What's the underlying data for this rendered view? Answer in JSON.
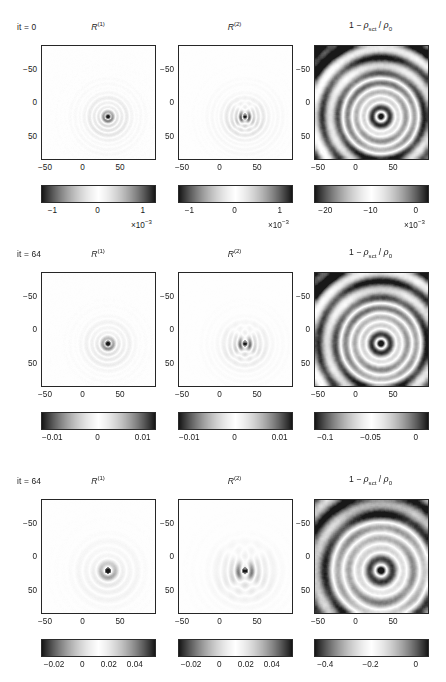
{
  "figure": {
    "type": "multi-panel-image-grid",
    "rows": 3,
    "columns": 3,
    "colormap": "diverging-gray (dark-white-dark)",
    "background": "#ffffff",
    "axis_color": "#262626"
  },
  "columns": [
    {
      "key": "R1",
      "title_main": "R",
      "title_sup": "(1)",
      "title_plain": "R^(1)"
    },
    {
      "key": "R2",
      "title_main": "R",
      "title_sup": "(2)",
      "title_plain": "R^(2)"
    },
    {
      "key": "rho",
      "title_plain": "1 − ρ_sct / ρ_0",
      "prefix": "1 − ",
      "rho_sym": "ρ",
      "sub_sct": "sct",
      "slash": " / ",
      "sub_0": "0"
    }
  ],
  "axes": {
    "x_ticks": [
      "−50",
      "0",
      "50"
    ],
    "y_ticks": [
      "−50",
      "0",
      "50"
    ],
    "x_tick_values": [
      -50,
      0,
      50
    ],
    "y_tick_values": [
      -50,
      0,
      50
    ],
    "xlim": [
      -75,
      75
    ],
    "ylim": [
      -75,
      75
    ],
    "grid": "off",
    "y_direction": "increasing-downward"
  },
  "rows": [
    {
      "id": "row-0",
      "it_label": "it = 0",
      "it_value": 0,
      "panels": [
        {
          "column": "R1",
          "cbar_ticks": [
            "−1",
            "0",
            "1"
          ],
          "cbar_tick_values": [
            -1,
            0,
            1
          ],
          "cbar_exponent": "×10",
          "cbar_exponent_sup": "−3",
          "cbar_range": [
            -1.6,
            1.6
          ],
          "cbar_units_scale": 0.001
        },
        {
          "column": "R2",
          "cbar_ticks": [
            "−1",
            "0",
            "1"
          ],
          "cbar_tick_values": [
            -1,
            0,
            1
          ],
          "cbar_exponent": "×10",
          "cbar_exponent_sup": "−3",
          "cbar_range": [
            -1.6,
            1.6
          ],
          "cbar_units_scale": 0.001
        },
        {
          "column": "rho",
          "cbar_ticks": [
            "−20",
            "−10",
            "0"
          ],
          "cbar_tick_values": [
            -20,
            -10,
            0
          ],
          "cbar_exponent": "×10",
          "cbar_exponent_sup": "−3",
          "cbar_range": [
            -23,
            3
          ],
          "cbar_units_scale": 0.001
        }
      ]
    },
    {
      "id": "row-1",
      "it_label": "it = 64",
      "it_value": 64,
      "panels": [
        {
          "column": "R1",
          "cbar_ticks": [
            "−0.01",
            "0",
            "0.01"
          ],
          "cbar_tick_values": [
            -0.01,
            0,
            0.01
          ],
          "cbar_exponent": null,
          "cbar_exponent_sup": null,
          "cbar_range": [
            -0.016,
            0.016
          ],
          "cbar_units_scale": 1
        },
        {
          "column": "R2",
          "cbar_ticks": [
            "−0.01",
            "0",
            "0.01"
          ],
          "cbar_tick_values": [
            -0.01,
            0,
            0.01
          ],
          "cbar_exponent": null,
          "cbar_exponent_sup": null,
          "cbar_range": [
            -0.016,
            0.016
          ],
          "cbar_units_scale": 1
        },
        {
          "column": "rho",
          "cbar_ticks": [
            "−0.1",
            "−0.05",
            "0"
          ],
          "cbar_tick_values": [
            -0.1,
            -0.05,
            0
          ],
          "cbar_exponent": null,
          "cbar_exponent_sup": null,
          "cbar_range": [
            -0.115,
            0.015
          ],
          "cbar_units_scale": 1
        }
      ]
    },
    {
      "id": "row-2",
      "it_label": "it = 64",
      "it_value": 64,
      "panels": [
        {
          "column": "R1",
          "cbar_ticks": [
            "−0.02",
            "0",
            "0.02",
            "0.04"
          ],
          "cbar_tick_values": [
            -0.02,
            0,
            0.02,
            0.04
          ],
          "cbar_exponent": null,
          "cbar_exponent_sup": null,
          "cbar_range": [
            -0.034,
            0.052
          ],
          "cbar_units_scale": 1
        },
        {
          "column": "R2",
          "cbar_ticks": [
            "−0.02",
            "0",
            "0.02",
            "0.04"
          ],
          "cbar_tick_values": [
            -0.02,
            0,
            0.02,
            0.04
          ],
          "cbar_exponent": null,
          "cbar_exponent_sup": null,
          "cbar_range": [
            -0.034,
            0.052
          ],
          "cbar_units_scale": 1
        },
        {
          "column": "rho",
          "cbar_ticks": [
            "−0.4",
            "−0.2",
            "0"
          ],
          "cbar_tick_values": [
            -0.4,
            -0.2,
            0
          ],
          "cbar_exponent": null,
          "cbar_exponent_sup": null,
          "cbar_range": [
            -0.46,
            0.06
          ],
          "cbar_units_scale": 1
        }
      ]
    }
  ],
  "chart_data": {
    "type": "heatmap",
    "title": "",
    "xlabel": "",
    "ylabel": "",
    "grid": false,
    "legend": "colorbar-below-each-panel",
    "panel_fields": [
      {
        "row": 0,
        "column": "R1",
        "pattern": "concentric-rings",
        "center": [
          12,
          18
        ],
        "n_rings": 9,
        "ring_period_px": 9.5,
        "amplitude_peak": 0.0016,
        "decay": 0.055,
        "source_offset": [
          0,
          0
        ],
        "noise": 0.055,
        "ringing_asym": 0.25
      },
      {
        "row": 0,
        "column": "R2",
        "pattern": "concentric-rings-dipole",
        "center": [
          12,
          18
        ],
        "n_rings": 9,
        "ring_period_px": 9.5,
        "amplitude_peak": 0.0016,
        "decay": 0.05,
        "dipole": 0.75,
        "noise": 0.055,
        "ringing_asym": 0.4
      },
      {
        "row": 0,
        "column": "rho",
        "pattern": "smooth-concentric-blobs",
        "center": [
          12,
          18
        ],
        "n_rings": 4,
        "ring_period_px": 17,
        "amplitude_peak": 0.021,
        "decay": 0.02,
        "noise": 0.12,
        "smooth": 2.6,
        "corner_dark": true
      },
      {
        "row": 1,
        "column": "R1",
        "pattern": "concentric-rings",
        "center": [
          12,
          18
        ],
        "n_rings": 8,
        "ring_period_px": 11,
        "amplitude_peak": 0.015,
        "decay": 0.06,
        "noise": 0.05,
        "ringing_asym": 0.28
      },
      {
        "row": 1,
        "column": "R2",
        "pattern": "concentric-rings-dipole",
        "center": [
          12,
          18
        ],
        "n_rings": 8,
        "ring_period_px": 11,
        "amplitude_peak": 0.015,
        "decay": 0.055,
        "dipole": 0.8,
        "noise": 0.05,
        "ringing_asym": 0.45
      },
      {
        "row": 1,
        "column": "rho",
        "pattern": "smooth-concentric-blobs",
        "center": [
          12,
          18
        ],
        "n_rings": 4,
        "ring_period_px": 18,
        "amplitude_peak": 0.105,
        "decay": 0.018,
        "noise": 0.13,
        "smooth": 2.4,
        "corner_dark": true
      },
      {
        "row": 2,
        "column": "R1",
        "pattern": "concentric-rings-sparse",
        "center": [
          12,
          18
        ],
        "n_rings": 5,
        "ring_period_px": 15,
        "amplitude_peak": 0.05,
        "decay": 0.05,
        "noise": 0.045,
        "ringing_asym": 0.3
      },
      {
        "row": 2,
        "column": "R2",
        "pattern": "concentric-rings-dipole",
        "center": [
          12,
          18
        ],
        "n_rings": 5,
        "ring_period_px": 15,
        "amplitude_peak": 0.05,
        "decay": 0.045,
        "dipole": 0.9,
        "noise": 0.045,
        "ringing_asym": 0.5
      },
      {
        "row": 2,
        "column": "rho",
        "pattern": "smooth-concentric-blobs",
        "center": [
          12,
          18
        ],
        "n_rings": 3,
        "ring_period_px": 22,
        "amplitude_peak": 0.42,
        "decay": 0.016,
        "noise": 0.14,
        "smooth": 2.2,
        "corner_dark": true
      }
    ]
  }
}
